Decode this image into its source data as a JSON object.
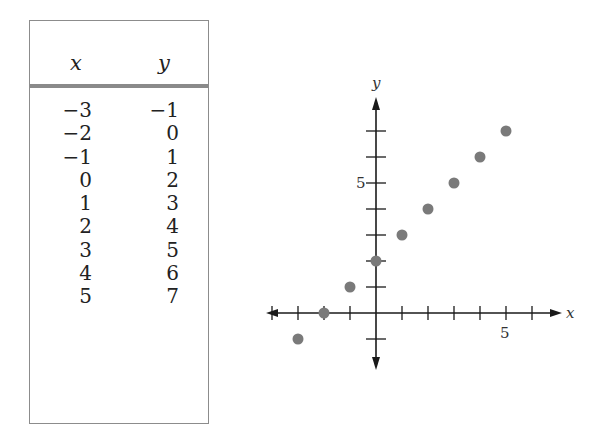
{
  "table": {
    "headers": {
      "x": "x",
      "y": "y"
    },
    "rows": [
      {
        "x": "−3",
        "y": "−1"
      },
      {
        "x": "−2",
        "y": "0"
      },
      {
        "x": "−1",
        "y": "1"
      },
      {
        "x": "0",
        "y": "2"
      },
      {
        "x": "1",
        "y": "3"
      },
      {
        "x": "2",
        "y": "4"
      },
      {
        "x": "3",
        "y": "5"
      },
      {
        "x": "4",
        "y": "6"
      },
      {
        "x": "5",
        "y": "7"
      }
    ]
  },
  "graph": {
    "x_label": "x",
    "y_label": "y",
    "x_tick_label": "5",
    "y_tick_label": "5"
  },
  "colors": {
    "point": "#7a7a7a",
    "axis": "#1a1a1a",
    "rule": "#8a8a8a"
  },
  "chart_data": [
    {
      "type": "table",
      "columns": [
        "x",
        "y"
      ],
      "rows": [
        [
          -3,
          -1
        ],
        [
          -2,
          0
        ],
        [
          -1,
          1
        ],
        [
          0,
          2
        ],
        [
          1,
          3
        ],
        [
          2,
          4
        ],
        [
          3,
          5
        ],
        [
          4,
          6
        ],
        [
          5,
          7
        ]
      ]
    },
    {
      "type": "scatter",
      "title": "",
      "xlabel": "x",
      "ylabel": "y",
      "x": [
        -3,
        -2,
        -1,
        0,
        1,
        2,
        3,
        4,
        5
      ],
      "y": [
        -1,
        0,
        1,
        2,
        3,
        4,
        5,
        6,
        7
      ],
      "xlim": [
        -4,
        7
      ],
      "ylim": [
        -2,
        8
      ],
      "x_ticks_labeled": [
        5
      ],
      "y_ticks_labeled": [
        5
      ],
      "grid": false,
      "legend": null
    }
  ]
}
